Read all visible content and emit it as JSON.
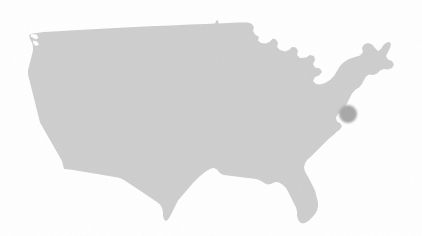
{
  "figure": {
    "title": "United States Map",
    "region_label": "Contiguous United States",
    "background_color": "#ffffff",
    "width": 422,
    "height": 236
  },
  "map": {
    "landmass_label": "United States landmass",
    "land_fill_color": "#cfcfcf",
    "land_edge_color": "#cbcbcb",
    "projection_note": "",
    "has_borders": false,
    "has_labels": false,
    "has_grid": false
  },
  "markers": [
    {
      "id": "marker-1",
      "label": "Location marker",
      "color": "#a9a9a9",
      "x": 348,
      "y": 114,
      "radius": 9
    }
  ]
}
